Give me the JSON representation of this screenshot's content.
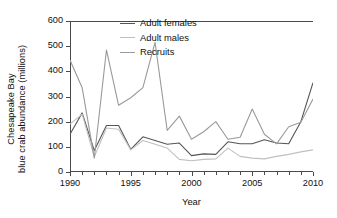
{
  "chart_data": {
    "type": "line",
    "title": "",
    "xlabel": "Year",
    "ylabel": "Chesapeake Bay\nblue crab abundance (millions)",
    "ylabel_line1": "Chesapeake Bay",
    "ylabel_line2": "blue crab abundance (millions)",
    "xlim": [
      1990,
      2010
    ],
    "ylim": [
      0,
      600
    ],
    "yticks": [
      0,
      100,
      200,
      300,
      400,
      500,
      600
    ],
    "xticks": [
      1990,
      1995,
      2000,
      2005,
      2010
    ],
    "xtick_minor_step": 1,
    "grid": false,
    "legend_position": "top-right-inside",
    "x": [
      1990,
      1991,
      1992,
      1993,
      1994,
      1995,
      1996,
      1997,
      1998,
      1999,
      2000,
      2001,
      2002,
      2003,
      2004,
      2005,
      2006,
      2007,
      2008,
      2009,
      2010
    ],
    "series": [
      {
        "name": "Adult females",
        "color": "#555555",
        "values": [
          150,
          235,
          85,
          185,
          185,
          90,
          140,
          125,
          110,
          115,
          65,
          72,
          70,
          120,
          112,
          112,
          128,
          115,
          112,
          200,
          355
        ]
      },
      {
        "name": "Adult males",
        "color": "#c0c0c0",
        "values": [
          190,
          230,
          60,
          175,
          170,
          88,
          125,
          110,
          95,
          50,
          45,
          50,
          52,
          95,
          62,
          55,
          52,
          62,
          70,
          80,
          88
        ]
      },
      {
        "name": "Recruits",
        "color": "#9a9a9a",
        "values": [
          445,
          335,
          55,
          485,
          265,
          295,
          335,
          515,
          165,
          222,
          130,
          160,
          200,
          130,
          138,
          250,
          150,
          112,
          180,
          198,
          290
        ]
      }
    ]
  },
  "legend": {
    "items": [
      {
        "label": "Adult females"
      },
      {
        "label": "Adult males"
      },
      {
        "label": "Recruits"
      }
    ]
  }
}
